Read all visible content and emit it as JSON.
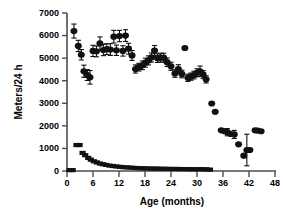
{
  "chart_data": {
    "type": "scatter",
    "title": "",
    "xlabel": "Age (months)",
    "ylabel": "Meters/24 h",
    "xlim": [
      0,
      48
    ],
    "ylim": [
      0,
      7000
    ],
    "xticks": [
      0,
      6,
      12,
      18,
      24,
      30,
      36,
      42,
      48
    ],
    "yticks": [
      0,
      1000,
      2000,
      3000,
      4000,
      5000,
      6000,
      7000
    ],
    "grid": false,
    "legend": "none",
    "marker_colors": {
      "circles": "#111111",
      "squares": "#111111"
    },
    "series": [
      {
        "name": "Running distance",
        "marker": "circle",
        "points": [
          {
            "x": 1.6,
            "y": 6200,
            "err": 310
          },
          {
            "x": 2.6,
            "y": 5540,
            "err": 250
          },
          {
            "x": 3.3,
            "y": 5150,
            "err": 230
          },
          {
            "x": 3.9,
            "y": 4420,
            "err": 270
          },
          {
            "x": 4.7,
            "y": 4250,
            "err": 240
          },
          {
            "x": 5.3,
            "y": 4150,
            "err": 300
          },
          {
            "x": 6.0,
            "y": 5320,
            "err": 250
          },
          {
            "x": 6.8,
            "y": 5300,
            "err": 240
          },
          {
            "x": 7.6,
            "y": 5650,
            "err": 290
          },
          {
            "x": 8.4,
            "y": 5360,
            "err": 250
          },
          {
            "x": 9.2,
            "y": 5400,
            "err": 240
          },
          {
            "x": 10.0,
            "y": 5380,
            "err": 260
          },
          {
            "x": 10.8,
            "y": 5950,
            "err": 280
          },
          {
            "x": 11.4,
            "y": 5350,
            "err": 230
          },
          {
            "x": 12.1,
            "y": 5980,
            "err": 250
          },
          {
            "x": 12.9,
            "y": 5320,
            "err": 230
          },
          {
            "x": 13.5,
            "y": 6000,
            "err": 260
          },
          {
            "x": 14.2,
            "y": 5420,
            "err": 240
          },
          {
            "x": 15.0,
            "y": 5120,
            "err": 220
          },
          {
            "x": 15.8,
            "y": 4520,
            "err": 180
          },
          {
            "x": 16.6,
            "y": 4600,
            "err": 170
          },
          {
            "x": 17.4,
            "y": 4680,
            "err": 190
          },
          {
            "x": 18.1,
            "y": 4800,
            "err": 200
          },
          {
            "x": 18.8,
            "y": 4900,
            "err": 200
          },
          {
            "x": 19.5,
            "y": 5030,
            "err": 200
          },
          {
            "x": 20.2,
            "y": 5330,
            "err": 230
          },
          {
            "x": 20.9,
            "y": 5000,
            "err": 190
          },
          {
            "x": 21.6,
            "y": 5020,
            "err": 200
          },
          {
            "x": 22.3,
            "y": 5020,
            "err": 200
          },
          {
            "x": 23.1,
            "y": 4820,
            "err": 190
          },
          {
            "x": 24.0,
            "y": 4640,
            "err": 180
          },
          {
            "x": 24.9,
            "y": 4320,
            "err": 170
          },
          {
            "x": 25.7,
            "y": 4520,
            "err": 190
          },
          {
            "x": 26.5,
            "y": 4300,
            "err": 170
          },
          {
            "x": 27.2,
            "y": 5450,
            "err": 0
          },
          {
            "x": 27.9,
            "y": 4130,
            "err": 160
          },
          {
            "x": 28.6,
            "y": 4180,
            "err": 160
          },
          {
            "x": 29.3,
            "y": 4250,
            "err": 170
          },
          {
            "x": 30.0,
            "y": 4350,
            "err": 180
          },
          {
            "x": 30.7,
            "y": 4420,
            "err": 230
          },
          {
            "x": 31.4,
            "y": 4280,
            "err": 170
          },
          {
            "x": 32.1,
            "y": 4060,
            "err": 160
          },
          {
            "x": 33.4,
            "y": 2990,
            "err": 0
          },
          {
            "x": 34.2,
            "y": 2620,
            "err": 0
          },
          {
            "x": 35.6,
            "y": 1800,
            "err": 0
          },
          {
            "x": 36.4,
            "y": 1760,
            "err": 0
          },
          {
            "x": 37.0,
            "y": 1720,
            "err": 160
          },
          {
            "x": 37.8,
            "y": 1640,
            "err": 0
          },
          {
            "x": 38.6,
            "y": 1620,
            "err": 180
          },
          {
            "x": 39.6,
            "y": 1180,
            "err": 0
          },
          {
            "x": 40.8,
            "y": 680,
            "err": 0
          },
          {
            "x": 41.5,
            "y": 930,
            "err": 700
          },
          {
            "x": 42.2,
            "y": 930,
            "err": 0
          },
          {
            "x": 43.4,
            "y": 1800,
            "err": 0
          },
          {
            "x": 44.0,
            "y": 1790,
            "err": 0
          },
          {
            "x": 44.8,
            "y": 1760,
            "err": 0
          }
        ]
      },
      {
        "name": "Body mass index",
        "marker": "square",
        "points": [
          {
            "x": 0.6,
            "y": 40
          },
          {
            "x": 1.3,
            "y": 40
          },
          {
            "x": 2.2,
            "y": 1150
          },
          {
            "x": 2.9,
            "y": 1150
          },
          {
            "x": 3.6,
            "y": 800
          },
          {
            "x": 4.2,
            "y": 700
          },
          {
            "x": 4.9,
            "y": 580
          },
          {
            "x": 5.5,
            "y": 500
          },
          {
            "x": 6.2,
            "y": 430
          },
          {
            "x": 6.9,
            "y": 380
          },
          {
            "x": 7.6,
            "y": 330
          },
          {
            "x": 8.3,
            "y": 300
          },
          {
            "x": 9.0,
            "y": 270
          },
          {
            "x": 9.8,
            "y": 240
          },
          {
            "x": 10.6,
            "y": 220
          },
          {
            "x": 11.4,
            "y": 200
          },
          {
            "x": 12.2,
            "y": 185
          },
          {
            "x": 13.0,
            "y": 170
          },
          {
            "x": 13.8,
            "y": 160
          },
          {
            "x": 14.6,
            "y": 150
          },
          {
            "x": 15.4,
            "y": 140
          },
          {
            "x": 16.2,
            "y": 130
          },
          {
            "x": 17.0,
            "y": 125
          },
          {
            "x": 17.8,
            "y": 120
          },
          {
            "x": 18.6,
            "y": 115
          },
          {
            "x": 19.4,
            "y": 110
          },
          {
            "x": 20.2,
            "y": 108
          },
          {
            "x": 21.0,
            "y": 105
          },
          {
            "x": 21.8,
            "y": 100
          },
          {
            "x": 22.6,
            "y": 98
          },
          {
            "x": 23.4,
            "y": 95
          },
          {
            "x": 24.2,
            "y": 92
          },
          {
            "x": 25.0,
            "y": 90
          },
          {
            "x": 25.8,
            "y": 88
          },
          {
            "x": 26.6,
            "y": 86
          },
          {
            "x": 27.4,
            "y": 84
          },
          {
            "x": 28.2,
            "y": 82
          },
          {
            "x": 29.0,
            "y": 80
          },
          {
            "x": 29.8,
            "y": 80
          },
          {
            "x": 30.6,
            "y": 80
          },
          {
            "x": 31.4,
            "y": 78
          },
          {
            "x": 32.2,
            "y": 76
          },
          {
            "x": 33.0,
            "y": 60
          }
        ]
      }
    ]
  }
}
